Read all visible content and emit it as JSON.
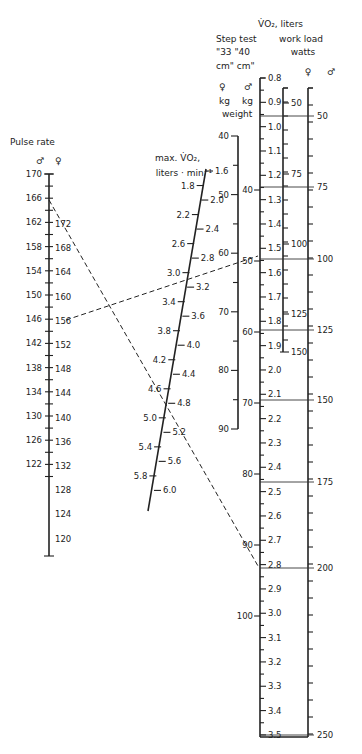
{
  "chart_data": {
    "type": "nomogram",
    "title": "",
    "axes": [
      {
        "name": "Pulse rate",
        "sublabels": [
          "♂",
          "♀"
        ],
        "male_ticks": [
          170,
          166,
          162,
          158,
          154,
          150,
          146,
          142,
          138,
          134,
          130,
          126,
          122
        ],
        "female_ticks": [
          172,
          168,
          164,
          160,
          156,
          152,
          148,
          144,
          140,
          136,
          132,
          128,
          124,
          120
        ]
      },
      {
        "name": "max. V̇O2, liters · min⁻¹",
        "ticks_left": [
          1.8,
          2.2,
          2.6,
          3.0,
          3.4,
          3.8,
          4.2,
          4.6,
          5.0,
          5.4,
          5.8
        ],
        "ticks_right": [
          1.6,
          2.0,
          2.4,
          2.8,
          3.2,
          3.6,
          4.0,
          4.4,
          4.8,
          5.2,
          5.6,
          6.0
        ]
      },
      {
        "name": "Step test weight",
        "sublabels": [
          "♀ 33 cm kg",
          "♂ 40 cm kg"
        ],
        "female_kg": [
          40,
          50,
          60,
          70,
          80,
          90
        ],
        "male_kg": [
          40,
          50,
          60,
          70,
          80,
          90,
          100
        ]
      },
      {
        "name": "V̇O2, liters",
        "ticks": [
          0.8,
          0.9,
          1.0,
          1.1,
          1.2,
          1.3,
          1.4,
          1.5,
          1.6,
          1.7,
          1.8,
          1.9,
          2.0,
          2.1,
          2.2,
          2.3,
          2.4,
          2.5,
          2.6,
          2.7,
          2.8,
          2.9,
          3.0,
          3.1,
          3.2,
          3.3,
          3.4,
          3.5
        ]
      },
      {
        "name": "work load watts",
        "female_ticks": [
          50,
          75,
          100,
          125,
          150
        ],
        "male_ticks": [
          50,
          75,
          100,
          125,
          150,
          175,
          200,
          250
        ]
      }
    ],
    "example_lines": [
      {
        "from": "pulse ♀ 156",
        "through": "max VO2 2.4",
        "to": "step weight ♂ 50 kg"
      },
      {
        "from": "pulse ♂ 166",
        "through": "max VO2 3.6",
        "to": "VO2 2.8 / work load 200 W"
      }
    ]
  },
  "labels": {
    "pulse_title": "Pulse rate",
    "male": "♂",
    "female": "♀",
    "vo2max_title_1": "max. V̇O₂,",
    "vo2max_title_2": "liters · min⁻¹",
    "vo2_title": "V̇O₂, liters",
    "step_title_1": "Step test",
    "step_title_2": "\"33 \"40",
    "step_title_3": "cm\" cm\"",
    "kg": "kg",
    "weight": "weight",
    "workload_title_1": "work load",
    "workload_title_2": "watts"
  }
}
